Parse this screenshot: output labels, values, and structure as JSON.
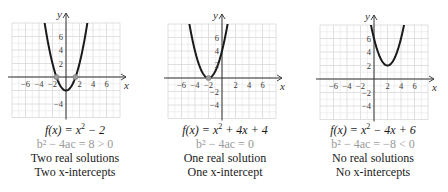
{
  "figure": {
    "panels": [
      {
        "function_label": "f(x) = x² − 2",
        "fn_pre": "f(x) = x",
        "fn_exp": "2",
        "fn_post": " − 2",
        "discriminant": "b² − 4ac = 8 > 0",
        "solutions": "Two real solutions",
        "intercepts": "Two x-intercepts",
        "coeffs": {
          "a": 1,
          "b": 0,
          "c": -2
        },
        "marked_points": [
          [
            -1.414,
            0
          ],
          [
            1.414,
            0
          ]
        ],
        "origin_px": [
          66,
          77
        ]
      },
      {
        "function_label": "f(x) = x² + 4x + 4",
        "fn_pre": "f(x) = x",
        "fn_exp": "2",
        "fn_post": " + 4x + 4",
        "discriminant": "b² − 4ac = 0",
        "solutions": "One real solution",
        "intercepts": "One x-intercept",
        "coeffs": {
          "a": 1,
          "b": 4,
          "c": 4
        },
        "marked_points": [
          [
            -2,
            0
          ]
        ],
        "origin_px": [
          72,
          78
        ]
      },
      {
        "function_label": "f(x) = x² − 4x + 6",
        "fn_pre": "f(x) = x",
        "fn_exp": "2",
        "fn_post": " − 4x + 6",
        "discriminant": "b² − 4ac = −8 < 0",
        "solutions": "No real solutions",
        "intercepts": "No x-intercepts",
        "coeffs": {
          "a": 1,
          "b": -4,
          "c": 6
        },
        "marked_points": [],
        "origin_px": [
          76,
          79
        ]
      }
    ],
    "axes": {
      "x_label": "x",
      "y_label": "y",
      "x_ticks": [
        "−6",
        "−4",
        "−2",
        "2",
        "4",
        "6"
      ],
      "x_tick_values": [
        -6,
        -4,
        -2,
        2,
        4,
        6
      ],
      "y_ticks_up": [
        "2",
        "4",
        "6"
      ],
      "y_ticks_down": [
        "−2",
        "−4"
      ],
      "grid_unit_px": 6.75,
      "grid_range_x": [
        -8,
        8
      ],
      "grid_range_y": [
        -6,
        8
      ]
    },
    "colors": {
      "curve": "#1a1a1a",
      "grid": "#d8d8d8",
      "axis": "#333333",
      "point": "#9a9a9a",
      "discriminant_text": "#9a9a9a"
    }
  }
}
